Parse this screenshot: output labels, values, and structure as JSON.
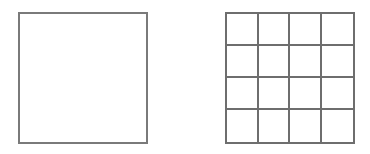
{
  "diagram": {
    "shapes": [
      {
        "id": "single-square",
        "type": "square",
        "divisions": 1,
        "stroke": "#7a7a7a"
      },
      {
        "id": "grid-square",
        "type": "square-grid",
        "rows": 4,
        "cols": 4,
        "divisions": 16,
        "stroke": "#6e6e6e"
      }
    ]
  }
}
